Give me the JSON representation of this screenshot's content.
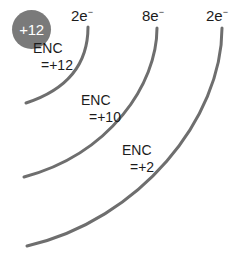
{
  "diagram": {
    "type": "atomic-shell-diagram",
    "width": 245,
    "height": 266,
    "background_color": "#ffffff",
    "stroke_color": "#6e6e6e",
    "nucleus_color": "#7a7a7a",
    "text_color": "#1c1c1c"
  },
  "nucleus": {
    "charge_label": "+12"
  },
  "shells": [
    {
      "id": "shell-1",
      "electron_label_number": "2",
      "electron_label_symbol": "e",
      "electron_label_charge": "−",
      "electron_label_full": "2e⁻",
      "enc_title": "ENC",
      "enc_value": "=+12"
    },
    {
      "id": "shell-2",
      "electron_label_number": "8",
      "electron_label_symbol": "e",
      "electron_label_charge": "−",
      "electron_label_full": "8e⁻",
      "enc_title": "ENC",
      "enc_value": "=+10"
    },
    {
      "id": "shell-3",
      "electron_label_number": "2",
      "electron_label_symbol": "e",
      "electron_label_charge": "−",
      "electron_label_full": "2e⁻",
      "enc_title": "ENC",
      "enc_value": "=+2"
    }
  ]
}
